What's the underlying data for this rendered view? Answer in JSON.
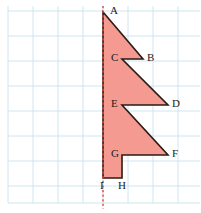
{
  "figure": {
    "title_visible": false,
    "background_color": "#ffffff",
    "grid": {
      "line_color": "#cfe4f2",
      "spacing_px": 25,
      "origin_x_px": 8,
      "origin_y_px": 11,
      "x_lines": [
        8,
        33,
        58,
        83,
        103,
        128,
        153,
        178
      ],
      "y_lines": [
        11,
        36,
        61,
        86,
        111,
        136,
        161,
        186,
        203
      ],
      "visible": true
    },
    "symmetry_line": {
      "name": "line-of-symmetry",
      "color": "#e8472e",
      "style": "dashed",
      "x_px": 103,
      "y_top_px": 6,
      "y_bottom_px": 209
    },
    "shape": {
      "fill_color": "#f59a90",
      "stroke_color": "#2b1b16",
      "stroke_width": 1.6,
      "points": "103,12 143,59 122,59 168,105 122,105 168,155 122,155 122,178 103,178"
    },
    "vertices": [
      {
        "label": "A",
        "x": 103,
        "y": 12,
        "label_x": 110,
        "label_y": 5
      },
      {
        "label": "B",
        "x": 143,
        "y": 59,
        "label_x": 147,
        "label_y": 52
      },
      {
        "label": "C",
        "x": 122,
        "y": 59,
        "label_x": 111,
        "label_y": 52
      },
      {
        "label": "D",
        "x": 168,
        "y": 105,
        "label_x": 172,
        "label_y": 98
      },
      {
        "label": "E",
        "x": 122,
        "y": 105,
        "label_x": 111,
        "label_y": 98
      },
      {
        "label": "F",
        "x": 168,
        "y": 155,
        "label_x": 172,
        "label_y": 148
      },
      {
        "label": "G",
        "x": 122,
        "y": 155,
        "label_x": 111,
        "label_y": 148
      },
      {
        "label": "H",
        "x": 122,
        "y": 178,
        "label_x": 118,
        "label_y": 180
      },
      {
        "label": "I",
        "x": 103,
        "y": 178,
        "label_x": 100,
        "label_y": 180
      }
    ]
  }
}
